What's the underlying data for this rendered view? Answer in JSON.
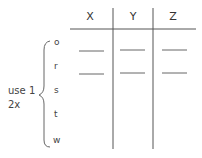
{
  "table": {
    "columns": [
      "X",
      "Y",
      "Z"
    ],
    "rows": [
      "o",
      "r",
      "s",
      "t",
      "w"
    ],
    "blank_rows": [
      "o",
      "r"
    ]
  },
  "annotation": {
    "line1": "use 1",
    "line2": "2x"
  },
  "colors": {
    "line": "#555555",
    "text": "#444444",
    "background": "#ffffff"
  }
}
